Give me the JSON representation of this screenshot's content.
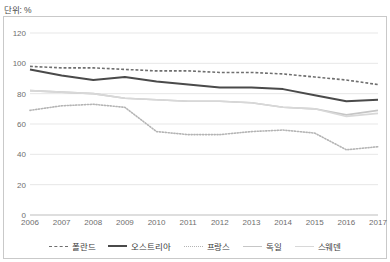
{
  "unit_label": "단위: %",
  "chart_data": {
    "type": "line",
    "title": "",
    "subtitle": "",
    "xlabel": "",
    "ylabel": "",
    "unit": "단위: %",
    "grid": true,
    "legend_position": "bottom",
    "ylim": [
      0,
      120
    ],
    "yticks": [
      0,
      20,
      40,
      60,
      80,
      100,
      120
    ],
    "categories": [
      "2006",
      "2007",
      "2008",
      "2009",
      "2010",
      "2011",
      "2012",
      "2013",
      "2014",
      "2015",
      "2016",
      "2017"
    ],
    "x": [
      2006,
      2007,
      2008,
      2009,
      2010,
      2011,
      2012,
      2013,
      2014,
      2015,
      2016,
      2017
    ],
    "series": [
      {
        "name": "폴란드",
        "style": "dashed",
        "color": "#6f6f6f",
        "width": 1.6,
        "values": [
          98,
          97,
          97,
          96,
          95,
          95,
          94,
          94,
          93,
          91,
          89,
          86
        ]
      },
      {
        "name": "오스트리아",
        "style": "solid",
        "color": "#4a4a4a",
        "width": 2.0,
        "values": [
          96,
          92,
          89,
          91,
          88,
          86,
          84,
          84,
          83,
          79,
          75,
          76
        ]
      },
      {
        "name": "프랑스",
        "style": "dotted",
        "color": "#b4b4b4",
        "width": 1.6,
        "values": [
          69,
          72,
          73,
          71,
          55,
          53,
          53,
          55,
          56,
          54,
          43,
          45
        ]
      },
      {
        "name": "독일",
        "style": "solid",
        "color": "#c6c6c6",
        "width": 1.6,
        "values": [
          82,
          81,
          80,
          77,
          76,
          75,
          75,
          74,
          71,
          70,
          66,
          69
        ]
      },
      {
        "name": "스웨덴",
        "style": "solid",
        "color": "#d8d8d8",
        "width": 1.6,
        "values": [
          82,
          81,
          80,
          77,
          76,
          75,
          75,
          74,
          71,
          70,
          65,
          67
        ]
      }
    ]
  }
}
